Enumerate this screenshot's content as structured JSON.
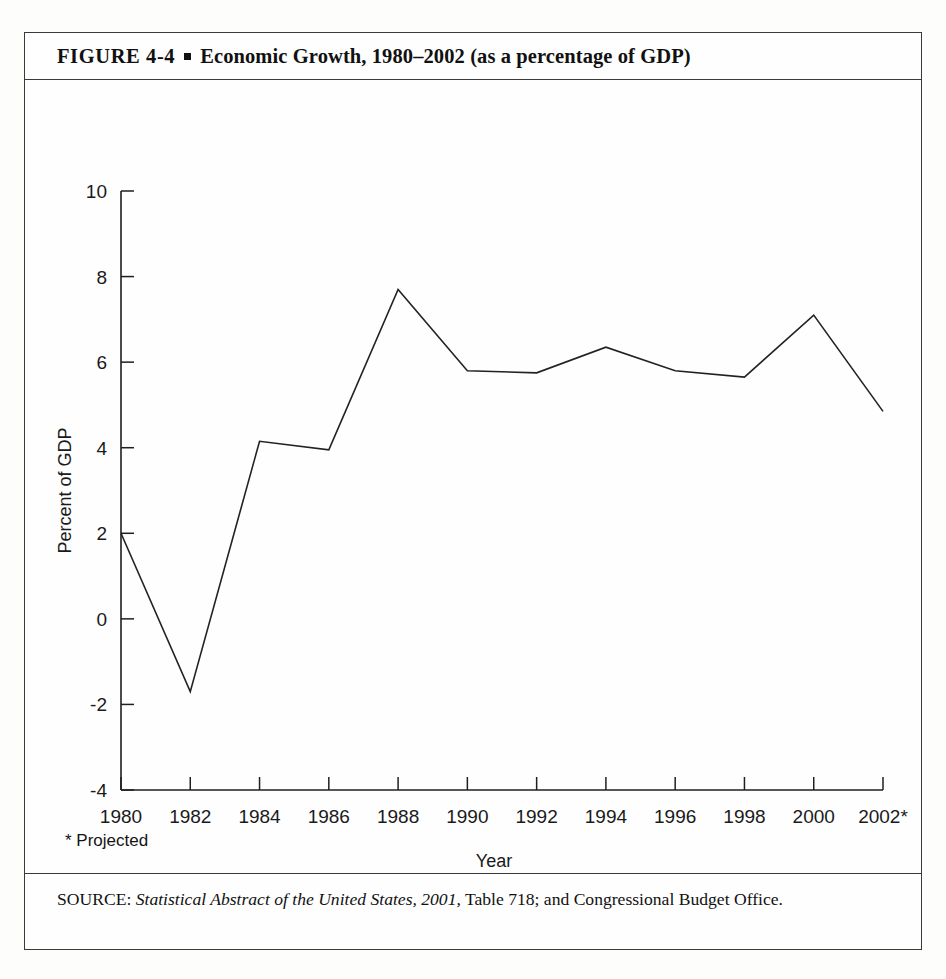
{
  "figure": {
    "label": "FIGURE  4-4",
    "bullet": "square-bullet",
    "title": "Economic Growth, 1980–2002 (as a percentage of GDP)"
  },
  "footnote": "* Projected",
  "source": {
    "prefix": "SOURCE:",
    "italic_title": "Statistical Abstract of the United States, 2001,",
    "rest": " Table 718; and Congressional Budget Office."
  },
  "chart_data": {
    "type": "line",
    "title": "Economic Growth, 1980–2002 (as a percentage of GDP)",
    "xlabel": "Year",
    "ylabel": "Percent of GDP",
    "categories": [
      "1980",
      "1982",
      "1984",
      "1986",
      "1988",
      "1990",
      "1992",
      "1994",
      "1996",
      "1998",
      "2000",
      "2002*"
    ],
    "x": [
      1980,
      1982,
      1984,
      1986,
      1988,
      1990,
      1992,
      1994,
      1996,
      1998,
      2000,
      2002
    ],
    "values": [
      2.0,
      -1.7,
      4.15,
      3.95,
      7.7,
      5.8,
      5.75,
      6.35,
      5.8,
      5.65,
      7.1,
      4.85
    ],
    "ylim": [
      -4,
      10
    ],
    "yticks": [
      10,
      8,
      6,
      4,
      2,
      0,
      -2,
      -4
    ],
    "yticklabels": [
      "10",
      "8",
      "6",
      "4",
      "2",
      "0",
      "-2",
      "-4"
    ],
    "xlim": [
      1980,
      2002
    ],
    "grid": false,
    "legend": null,
    "line_color": "#222222",
    "line_width": 1.6,
    "markers": false,
    "annotations": [
      "* Projected"
    ]
  }
}
